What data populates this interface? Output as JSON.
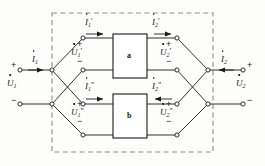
{
  "figure": {
    "type": "circuit-diagram",
    "canvas": {
      "width": 265,
      "height": 166
    },
    "colors": {
      "wire": "#1a1a1a",
      "dashed_border": "#8c8c8c",
      "background": "#fdfdfb",
      "node_fill": "#ffffff",
      "box_fill": "#ffffff",
      "text": "#1a1a1a"
    }
  },
  "boundary": {
    "name": "composite-two-port-boundary",
    "style": "dashed",
    "x": 52,
    "y": 13,
    "width": 161,
    "height": 139
  },
  "blocks": [
    {
      "id": "a",
      "label": "a",
      "x": 113,
      "y": 34,
      "width": 34,
      "height": 44
    },
    {
      "id": "b",
      "label": "b",
      "x": 113,
      "y": 94,
      "width": 34,
      "height": 44
    }
  ],
  "terminals": {
    "input": {
      "plus_label": "+",
      "minus_label": "−",
      "voltage": "U",
      "voltage_sub": "1",
      "voltage_prime": "",
      "current": "I",
      "current_sub": "1",
      "current_prime": "",
      "current_direction": "right"
    },
    "output": {
      "plus_label": "+",
      "minus_label": "−",
      "voltage": "U",
      "voltage_sub": "2",
      "voltage_prime": "",
      "current": "I",
      "current_sub": "2",
      "current_prime": "",
      "current_direction": "left"
    }
  },
  "labels": {
    "i1_prime": {
      "base": "I",
      "sub": "1",
      "prime": "′",
      "x": 86,
      "y": 21
    },
    "i2_prime": {
      "base": "I",
      "sub": "2",
      "prime": "′",
      "x": 152,
      "y": 21
    },
    "u1_prime": {
      "base": "U",
      "sub": "1",
      "prime": "′",
      "x": 73,
      "y": 51
    },
    "u2_prime": {
      "base": "U",
      "sub": "2",
      "prime": "′",
      "x": 162,
      "y": 51
    },
    "i1_dprime": {
      "base": "I",
      "sub": "1",
      "prime": "″",
      "x": 86,
      "y": 84
    },
    "i2_dprime": {
      "base": "I",
      "sub": "2",
      "prime": "″",
      "x": 152,
      "y": 84
    },
    "u1_dprime": {
      "base": "U",
      "sub": "1",
      "prime": "″",
      "x": 73,
      "y": 112
    },
    "u2_dprime": {
      "base": "U",
      "sub": "2",
      "prime": "″",
      "x": 162,
      "y": 112
    },
    "u1_main": {
      "base": "U",
      "sub": "1",
      "prime": "",
      "x": 9,
      "y": 83
    },
    "u2_main": {
      "base": "U",
      "sub": "2",
      "prime": "",
      "x": 238,
      "y": 83
    },
    "i1_main": {
      "base": "I",
      "sub": "1",
      "prime": "",
      "x": 34,
      "y": 59
    },
    "i2_main": {
      "base": "I",
      "sub": "2",
      "prime": "",
      "x": 223,
      "y": 59
    }
  },
  "signs": {
    "input_plus": {
      "text": "+",
      "x": 11,
      "y": 64
    },
    "input_minus": {
      "text": "−",
      "x": 11,
      "y": 99
    },
    "output_plus": {
      "text": "+",
      "x": 248,
      "y": 64
    },
    "output_minus": {
      "text": "−",
      "x": 248,
      "y": 99
    },
    "u1p_plus": {
      "text": "+",
      "x": 78,
      "y": 43
    },
    "u1p_minus": {
      "text": "−",
      "x": 78,
      "y": 60
    },
    "u2p_plus": {
      "text": "+",
      "x": 167,
      "y": 43
    },
    "u2p_minus": {
      "text": "−",
      "x": 167,
      "y": 60
    },
    "u1pp_plus": {
      "text": "+",
      "x": 78,
      "y": 103
    },
    "u1pp_minus": {
      "text": "−",
      "x": 78,
      "y": 120
    },
    "u2pp_plus": {
      "text": "+",
      "x": 167,
      "y": 103
    },
    "u2pp_minus": {
      "text": "−",
      "x": 167,
      "y": 120
    }
  },
  "nodes": [
    {
      "name": "input-terminal-top",
      "x": 20,
      "y": 70
    },
    {
      "name": "input-terminal-bottom",
      "x": 20,
      "y": 104
    },
    {
      "name": "input-junction-top",
      "x": 52,
      "y": 70
    },
    {
      "name": "input-junction-bottom",
      "x": 52,
      "y": 104
    },
    {
      "name": "net-a-in-top",
      "x": 83,
      "y": 38
    },
    {
      "name": "net-a-in-bottom",
      "x": 83,
      "y": 70
    },
    {
      "name": "net-b-in-top",
      "x": 83,
      "y": 104
    },
    {
      "name": "net-b-in-bottom",
      "x": 83,
      "y": 135
    },
    {
      "name": "net-a-out-top",
      "x": 177,
      "y": 38
    },
    {
      "name": "net-a-out-bottom",
      "x": 177,
      "y": 70
    },
    {
      "name": "net-b-out-top",
      "x": 177,
      "y": 104
    },
    {
      "name": "net-b-out-bottom",
      "x": 177,
      "y": 135
    },
    {
      "name": "output-junction-top",
      "x": 208,
      "y": 70
    },
    {
      "name": "output-junction-bottom",
      "x": 208,
      "y": 104
    },
    {
      "name": "output-terminal-top",
      "x": 243,
      "y": 70
    },
    {
      "name": "output-terminal-bottom",
      "x": 243,
      "y": 104
    }
  ]
}
